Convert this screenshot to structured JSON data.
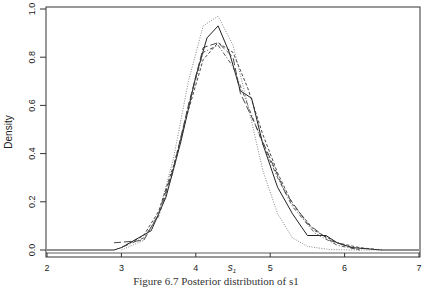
{
  "chart_data": {
    "type": "line",
    "title": "",
    "xlabel": "s1",
    "ylabel": "Density",
    "xlim": [
      2,
      7
    ],
    "ylim": [
      0,
      1.0
    ],
    "x_ticks": [
      "2",
      "3",
      "4",
      "5",
      "6",
      "7"
    ],
    "y_ticks": [
      "0.0",
      "0.2",
      "0.4",
      "0.6",
      "0.8",
      "1.0"
    ],
    "grid": false,
    "legend": "none",
    "series": [
      {
        "name": "solid (histogram polygon)",
        "style": "solid",
        "x": [
          2.0,
          2.9,
          3.0,
          3.4,
          3.6,
          3.8,
          4.0,
          4.15,
          4.3,
          4.45,
          4.6,
          4.75,
          4.9,
          5.1,
          5.3,
          5.5,
          5.75,
          5.9,
          6.1,
          6.5,
          7.0
        ],
        "y": [
          0.0,
          0.0,
          0.01,
          0.08,
          0.22,
          0.45,
          0.72,
          0.88,
          0.93,
          0.82,
          0.66,
          0.63,
          0.44,
          0.26,
          0.15,
          0.06,
          0.06,
          0.03,
          0.01,
          0.0,
          0.0
        ]
      },
      {
        "name": "long-dash",
        "style": "longdash",
        "x": [
          2.9,
          3.3,
          3.5,
          3.7,
          3.9,
          4.1,
          4.3,
          4.5,
          4.6,
          4.8,
          5.0,
          5.2,
          5.5,
          5.8,
          6.0,
          6.2
        ],
        "y": [
          0.03,
          0.04,
          0.15,
          0.34,
          0.6,
          0.84,
          0.86,
          0.8,
          0.65,
          0.52,
          0.38,
          0.24,
          0.11,
          0.04,
          0.02,
          0.0
        ]
      },
      {
        "name": "short-dash",
        "style": "dashed",
        "x": [
          3.0,
          3.3,
          3.5,
          3.7,
          3.9,
          4.1,
          4.3,
          4.5,
          4.7,
          4.9,
          5.1,
          5.3,
          5.6,
          5.9,
          6.2,
          6.5
        ],
        "y": [
          0.01,
          0.06,
          0.16,
          0.35,
          0.58,
          0.79,
          0.86,
          0.82,
          0.67,
          0.48,
          0.32,
          0.19,
          0.08,
          0.03,
          0.01,
          0.0
        ]
      },
      {
        "name": "dot-dash",
        "style": "dotdash",
        "x": [
          3.0,
          3.3,
          3.5,
          3.7,
          3.9,
          4.1,
          4.3,
          4.5,
          4.7,
          4.9,
          5.1,
          5.3,
          5.6,
          5.9,
          6.2
        ],
        "y": [
          0.01,
          0.05,
          0.14,
          0.33,
          0.6,
          0.82,
          0.85,
          0.76,
          0.6,
          0.44,
          0.3,
          0.18,
          0.07,
          0.02,
          0.0
        ]
      },
      {
        "name": "dotted (normal approximation)",
        "style": "dotted",
        "x": [
          3.0,
          3.3,
          3.5,
          3.7,
          3.9,
          4.1,
          4.3,
          4.5,
          4.7,
          4.9,
          5.1,
          5.3,
          5.5,
          5.8,
          6.1,
          6.5
        ],
        "y": [
          0.0,
          0.04,
          0.15,
          0.38,
          0.7,
          0.93,
          0.97,
          0.85,
          0.6,
          0.33,
          0.15,
          0.05,
          0.015,
          0.002,
          0.0,
          0.0
        ]
      }
    ]
  },
  "caption": "Figure 6.7 Posterior distribution of s1"
}
